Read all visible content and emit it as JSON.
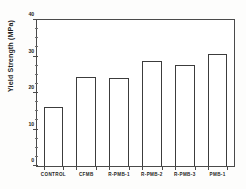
{
  "chart_data": {
    "type": "bar",
    "title": "",
    "xlabel": "",
    "ylabel": "Yield Strength (MPa)",
    "categories": [
      "CONTROL",
      "CFMB",
      "R-PMB-1",
      "R-PMB-2",
      "R-PMB-3",
      "PMB-1"
    ],
    "values": [
      16.2,
      24.5,
      24.0,
      28.7,
      27.8,
      30.8
    ],
    "ylim": [
      0,
      40
    ],
    "yticks": [
      0,
      10,
      20,
      30,
      40
    ],
    "ytick_labels": [
      "0",
      "10",
      "20",
      "30",
      "40"
    ],
    "yminor_step": 2.5,
    "grid": false,
    "legend": false,
    "bar_fill_color": "#ffffff",
    "bar_edge_color": "#3c3c3c",
    "axis_color": "#4a4a4a",
    "background_color": "#fdfdfc"
  }
}
